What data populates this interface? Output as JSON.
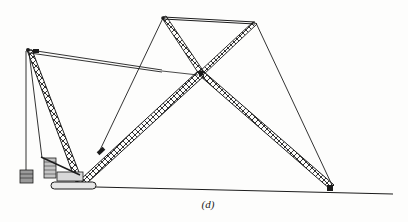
{
  "figure": {
    "caption": "(d)",
    "colors": {
      "line": "#1c1c1c",
      "background": "#fdfdfc",
      "fill": "#8a8a8a"
    }
  },
  "components": {
    "mast": {
      "label": "mast-lattice"
    },
    "main_boom": {
      "label": "main-boom-lattice"
    },
    "fly_jib": {
      "label": "fly-jib-lattice"
    },
    "top_strut": {
      "label": "strut-frame"
    },
    "pendant": {
      "label": "pendant-bar"
    },
    "hook_block": {
      "label": "counterweight-hook"
    },
    "crawler": {
      "label": "crawler-base"
    },
    "ground": {
      "label": "ground-line"
    }
  }
}
